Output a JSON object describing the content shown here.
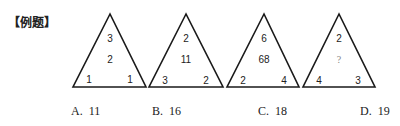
{
  "title": "【例题】",
  "triangles": [
    {
      "top": "3",
      "center": "2",
      "left": "1",
      "right": "1"
    },
    {
      "top": "2",
      "center": "11",
      "left": "3",
      "right": "2"
    },
    {
      "top": "6",
      "center": "68",
      "left": "2",
      "right": "4"
    },
    {
      "top": "2",
      "center": "?",
      "left": "4",
      "right": "3"
    }
  ],
  "options": [
    {
      "letter": "A.",
      "value": "11"
    },
    {
      "letter": "B.",
      "value": "16"
    },
    {
      "letter": "C.",
      "value": "18"
    },
    {
      "letter": "D.",
      "value": "19"
    }
  ]
}
